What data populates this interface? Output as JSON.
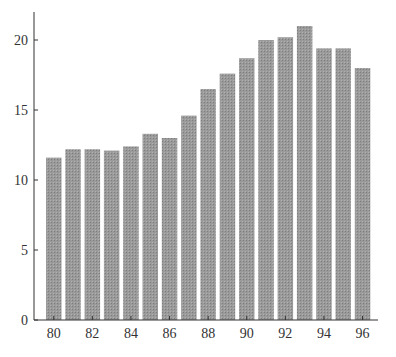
{
  "chart_data": {
    "type": "bar",
    "title": "",
    "xlabel": "",
    "ylabel": "",
    "categories": [
      "80",
      "81",
      "82",
      "83",
      "84",
      "85",
      "86",
      "87",
      "88",
      "89",
      "90",
      "91",
      "92",
      "93",
      "94",
      "95",
      "96"
    ],
    "values": [
      11.6,
      12.2,
      12.2,
      12.1,
      12.4,
      13.3,
      13.0,
      14.6,
      16.5,
      17.6,
      18.7,
      20.0,
      20.2,
      21.0,
      19.4,
      19.4,
      18.0
    ],
    "x_tick_labels": [
      "80",
      "82",
      "84",
      "86",
      "88",
      "90",
      "92",
      "94",
      "96"
    ],
    "y_ticks": [
      0,
      5,
      10,
      15,
      20
    ],
    "ylim": [
      0,
      22
    ],
    "grid": false,
    "legend": null,
    "bar_color": "#9a9a9a"
  }
}
